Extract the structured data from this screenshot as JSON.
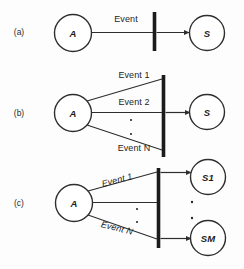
{
  "figure": {
    "background_color": "#fdfdfd",
    "ink_color": "#2e2e2e",
    "bar_color": "#1b1b1b"
  },
  "panels": [
    {
      "id": "a",
      "label": "(a)",
      "source_node": "A",
      "target_nodes": [
        "S"
      ],
      "events": [
        "Event"
      ],
      "vertical_dots": 0
    },
    {
      "id": "b",
      "label": "(b)",
      "source_node": "A",
      "target_nodes": [
        "S"
      ],
      "events": [
        "Event 1",
        "Event 2",
        "Event N"
      ],
      "vertical_dots": 2
    },
    {
      "id": "c",
      "label": "(c)",
      "source_node": "A",
      "target_nodes": [
        "S1",
        "SM"
      ],
      "events": [
        "Event 1",
        "Event N"
      ],
      "vertical_dots": 2,
      "target_dots": 2
    }
  ],
  "panel_a": {
    "label": "(a)",
    "node_a": "A",
    "node_s": "S",
    "event": "Event"
  },
  "panel_b": {
    "label": "(b)",
    "node_a": "A",
    "node_s": "S",
    "event_1": "Event 1",
    "event_2": "Event 2",
    "event_n": "Event N"
  },
  "panel_c": {
    "label": "(c)",
    "node_a": "A",
    "node_s1": "S1",
    "node_sm": "SM",
    "event_1": "Event 1",
    "event_n": "Event N"
  }
}
